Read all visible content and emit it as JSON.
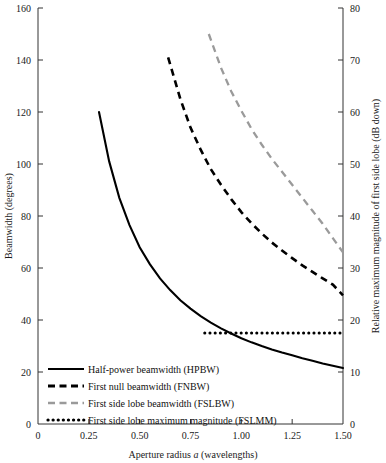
{
  "chart_data": {
    "type": "line",
    "title": "",
    "xlabel": "Aperture radius a (wavelengths)",
    "xlabel_parts": {
      "pre": "Aperture radius ",
      "italic": "a",
      "post": " (wavelengths)"
    },
    "ylabel": "Beamwidth (degrees)",
    "ylabel_right": "Relative maximum magnitude of first side lobe (dB down)",
    "xlim": [
      0,
      1.5
    ],
    "ylim": [
      0,
      160
    ],
    "ylim_right": [
      0,
      80
    ],
    "grid": false,
    "legend_position": "lower-left-inside",
    "xticks": [
      0,
      0.25,
      0.5,
      0.75,
      1.0,
      1.25,
      1.5
    ],
    "xticklabels": [
      "0",
      "0.25",
      "0.50",
      "0.75",
      "1.00",
      "1.25",
      "1.50"
    ],
    "yticks": [
      0,
      20,
      40,
      60,
      80,
      100,
      120,
      140,
      160
    ],
    "yticklabels": [
      "0",
      "20",
      "40",
      "60",
      "80",
      "100",
      "120",
      "140",
      "160"
    ],
    "yticks_right": [
      0,
      10,
      20,
      30,
      40,
      50,
      60,
      70,
      80
    ],
    "yticklabels_right": [
      "0",
      "10",
      "20",
      "30",
      "40",
      "50",
      "60",
      "70",
      "80"
    ],
    "series": [
      {
        "name": "Half-power beamwidth (HPBW)",
        "key": "hpbw",
        "style": "solid",
        "color": "#000000",
        "axis": "left",
        "x": [
          0.3,
          0.35,
          0.4,
          0.45,
          0.5,
          0.55,
          0.6,
          0.65,
          0.7,
          0.75,
          0.8,
          0.85,
          0.9,
          0.95,
          1.0,
          1.05,
          1.1,
          1.15,
          1.2,
          1.25,
          1.3,
          1.35,
          1.4,
          1.45,
          1.5
        ],
        "values": [
          120.0,
          101.0,
          87.0,
          76.5,
          68.0,
          61.5,
          56.0,
          51.5,
          47.6,
          44.4,
          41.5,
          39.0,
          36.8,
          34.8,
          33.0,
          31.4,
          30.0,
          28.7,
          27.5,
          26.4,
          25.3,
          24.3,
          23.3,
          22.4,
          21.5
        ]
      },
      {
        "name": "First null beamwidth (FNBW)",
        "key": "fnbw",
        "style": "dashed",
        "color": "#000000",
        "axis": "left",
        "x": [
          0.64,
          0.7,
          0.75,
          0.8,
          0.85,
          0.9,
          0.95,
          1.0,
          1.05,
          1.1,
          1.15,
          1.2,
          1.25,
          1.3,
          1.35,
          1.4,
          1.45,
          1.5
        ],
        "values": [
          141.0,
          125.0,
          114.0,
          105.5,
          98.0,
          92.0,
          86.5,
          81.5,
          77.2,
          73.3,
          69.8,
          66.7,
          63.8,
          61.0,
          58.5,
          56.0,
          53.6,
          49.5
        ]
      },
      {
        "name": "First side lobe beamwidth (FSLBW)",
        "key": "fslbw",
        "style": "dashed-gray",
        "color": "#9a9a9a",
        "axis": "left",
        "x": [
          0.84,
          0.9,
          0.95,
          1.0,
          1.05,
          1.1,
          1.15,
          1.2,
          1.25,
          1.3,
          1.35,
          1.4,
          1.45,
          1.5
        ],
        "values": [
          150.0,
          137.0,
          128.0,
          120.5,
          113.5,
          107.5,
          102.0,
          97.0,
          92.0,
          87.0,
          82.0,
          77.0,
          71.5,
          66.0
        ]
      },
      {
        "name": "First side lobe maximum magnitude (FSLMM)",
        "key": "fslmm",
        "style": "dotted",
        "color": "#000000",
        "axis": "right",
        "x": [
          0.82,
          0.9,
          1.0,
          1.1,
          1.2,
          1.3,
          1.4,
          1.5
        ],
        "values": [
          17.5,
          17.5,
          17.5,
          17.5,
          17.5,
          17.5,
          17.5,
          17.5
        ]
      }
    ],
    "legend": [
      {
        "label": "Half-power beamwidth (HPBW)",
        "style": "solid",
        "color": "#000000"
      },
      {
        "label": "First null beamwidth (FNBW)",
        "style": "dashed",
        "color": "#000000"
      },
      {
        "label": "First side lobe beamwidth (FSLBW)",
        "style": "dashed-gray",
        "color": "#9a9a9a"
      },
      {
        "label": "First side lobe maximum magnitude (FSLMM)",
        "style": "dotted",
        "color": "#000000"
      }
    ]
  }
}
